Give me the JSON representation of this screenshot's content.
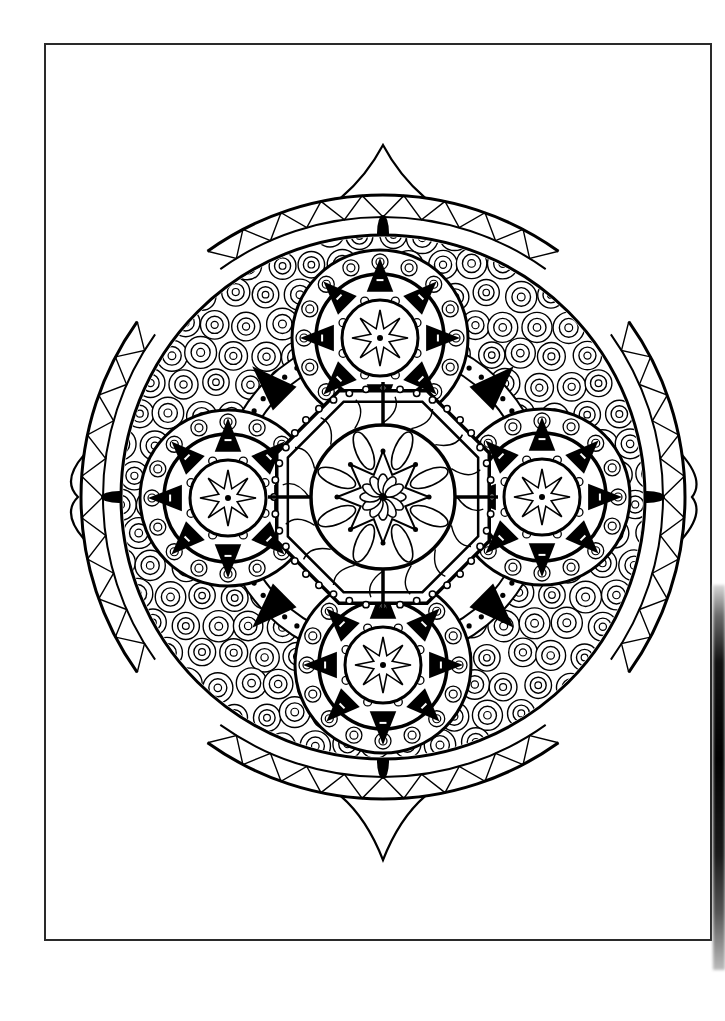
{
  "page": {
    "width": 725,
    "height": 1021,
    "background": "#ffffff",
    "frame": {
      "x": 44,
      "y": 43,
      "width": 668,
      "height": 898,
      "stroke": "#2a2a2a"
    },
    "edge_strip": {
      "side": "right",
      "y_start": 585,
      "y_end": 970
    }
  },
  "mandala": {
    "ink": "#000000",
    "paper": "#ffffff",
    "center": {
      "x": 383,
      "y": 497
    },
    "outer_radius": 262,
    "spires": [
      {
        "dir": "top",
        "tip": [
          383,
          145
        ]
      },
      {
        "dir": "bottom",
        "tip": [
          383,
          860
        ]
      },
      {
        "dir": "left",
        "tip": [
          78,
          497
        ]
      },
      {
        "dir": "right",
        "tip": [
          692,
          497
        ]
      }
    ],
    "central_medallion": {
      "cx": 383,
      "cy": 497,
      "r_outer": 105,
      "r_inner": 72,
      "petals": 12,
      "star_points": 8
    },
    "satellite_medallions": [
      {
        "name": "top",
        "cx": 380,
        "cy": 338,
        "r": 88
      },
      {
        "name": "bottom",
        "cx": 383,
        "cy": 665,
        "r": 88
      },
      {
        "name": "left",
        "cx": 228,
        "cy": 498,
        "r": 88
      },
      {
        "name": "right",
        "cx": 542,
        "cy": 497,
        "r": 88
      }
    ],
    "pattern": "concentric-circles-with-diamonds",
    "border_motif": "triangle-zigzag-band"
  }
}
